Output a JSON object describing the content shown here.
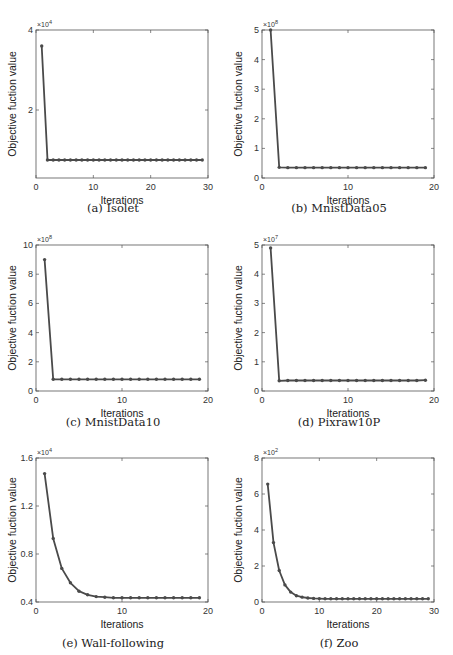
{
  "figure": {
    "panels": [
      {
        "id": "a",
        "caption": "(a) Isolet"
      },
      {
        "id": "b",
        "caption": "(b) MnistData05"
      },
      {
        "id": "c",
        "caption": "(c) MnistData10"
      },
      {
        "id": "d",
        "caption": "(d) Pixraw10P"
      },
      {
        "id": "e",
        "caption": "(e) Wall-following"
      },
      {
        "id": "f",
        "caption": "(f) Zoo"
      }
    ],
    "line_color": "#4a4a4a"
  },
  "chart_data": [
    {
      "type": "line",
      "title": "(a) Isolet",
      "xlabel": "Iterations",
      "ylabel": "Objective fuction value",
      "y_multiplier": "×10^4",
      "y_exponent": "4",
      "xlim": [
        0,
        30
      ],
      "ylim": [
        0.3,
        4
      ],
      "xticks": [
        0,
        10,
        20,
        30
      ],
      "yticks": [
        2,
        4
      ],
      "grid": false,
      "x": [
        1,
        2,
        3,
        4,
        5,
        6,
        7,
        8,
        9,
        10,
        11,
        12,
        13,
        14,
        15,
        16,
        17,
        18,
        19,
        20,
        21,
        22,
        23,
        24,
        25,
        26,
        27,
        28,
        29
      ],
      "y": [
        3.6,
        0.75,
        0.75,
        0.75,
        0.75,
        0.75,
        0.75,
        0.75,
        0.75,
        0.75,
        0.75,
        0.75,
        0.75,
        0.75,
        0.75,
        0.75,
        0.75,
        0.75,
        0.75,
        0.75,
        0.75,
        0.75,
        0.75,
        0.75,
        0.75,
        0.75,
        0.75,
        0.75,
        0.75
      ]
    },
    {
      "type": "line",
      "title": "(b) MnistData05",
      "xlabel": "Iterations",
      "ylabel": "Objective fuction value",
      "y_multiplier": "×10^8",
      "y_exponent": "8",
      "xlim": [
        0,
        20
      ],
      "ylim": [
        0,
        5
      ],
      "xticks": [
        0,
        10,
        20
      ],
      "yticks": [
        0,
        1,
        2,
        3,
        4,
        5
      ],
      "grid": false,
      "x": [
        1,
        2,
        3,
        4,
        5,
        6,
        7,
        8,
        9,
        10,
        11,
        12,
        13,
        14,
        15,
        16,
        17,
        18,
        19
      ],
      "y": [
        5.0,
        0.36,
        0.35,
        0.35,
        0.35,
        0.35,
        0.35,
        0.35,
        0.35,
        0.35,
        0.35,
        0.35,
        0.35,
        0.35,
        0.35,
        0.35,
        0.35,
        0.35,
        0.35
      ]
    },
    {
      "type": "line",
      "title": "(c) MnistData10",
      "xlabel": "Iterations",
      "ylabel": "Objective fuction value",
      "y_multiplier": "×10^8",
      "y_exponent": "8",
      "xlim": [
        0,
        20
      ],
      "ylim": [
        0,
        10
      ],
      "xticks": [
        0,
        10,
        20
      ],
      "yticks": [
        0,
        2,
        4,
        6,
        8,
        10
      ],
      "grid": false,
      "x": [
        1,
        2,
        3,
        4,
        5,
        6,
        7,
        8,
        9,
        10,
        11,
        12,
        13,
        14,
        15,
        16,
        17,
        18,
        19
      ],
      "y": [
        9.0,
        0.8,
        0.8,
        0.8,
        0.8,
        0.8,
        0.8,
        0.8,
        0.8,
        0.8,
        0.8,
        0.8,
        0.8,
        0.8,
        0.8,
        0.8,
        0.8,
        0.8,
        0.8
      ]
    },
    {
      "type": "line",
      "title": "(d) Pixraw10P",
      "xlabel": "Iterations",
      "ylabel": "Objective fuction value",
      "y_multiplier": "×10^7",
      "y_exponent": "7",
      "xlim": [
        0,
        20
      ],
      "ylim": [
        0,
        5
      ],
      "xticks": [
        0,
        10,
        20
      ],
      "yticks": [
        0,
        1,
        2,
        3,
        4,
        5
      ],
      "grid": false,
      "x": [
        1,
        2,
        3,
        4,
        5,
        6,
        7,
        8,
        9,
        10,
        11,
        12,
        13,
        14,
        15,
        16,
        17,
        18,
        19
      ],
      "y": [
        4.9,
        0.35,
        0.36,
        0.36,
        0.36,
        0.36,
        0.36,
        0.36,
        0.36,
        0.36,
        0.36,
        0.36,
        0.36,
        0.36,
        0.36,
        0.36,
        0.36,
        0.36,
        0.37
      ]
    },
    {
      "type": "line",
      "title": "(e) Wall-following",
      "xlabel": "Iterations",
      "ylabel": "Objective fuction value",
      "y_multiplier": "×10^4",
      "y_exponent": "4",
      "xlim": [
        0,
        20
      ],
      "ylim": [
        0.4,
        1.6
      ],
      "xticks": [
        0,
        10,
        20
      ],
      "yticks": [
        0.4,
        0.8,
        1.2,
        1.6
      ],
      "grid": false,
      "x": [
        1,
        2,
        3,
        4,
        5,
        6,
        7,
        8,
        9,
        10,
        11,
        12,
        13,
        14,
        15,
        16,
        17,
        18,
        19
      ],
      "y": [
        1.47,
        0.93,
        0.68,
        0.56,
        0.49,
        0.46,
        0.445,
        0.44,
        0.435,
        0.435,
        0.435,
        0.435,
        0.435,
        0.435,
        0.435,
        0.435,
        0.435,
        0.435,
        0.435
      ]
    },
    {
      "type": "line",
      "title": "(f) Zoo",
      "xlabel": "Iterations",
      "ylabel": "Objective fuction value",
      "y_multiplier": "×10^2",
      "y_exponent": "2",
      "xlim": [
        0,
        30
      ],
      "ylim": [
        0,
        8
      ],
      "xticks": [
        0,
        10,
        20,
        30
      ],
      "yticks": [
        0,
        2,
        4,
        6,
        8
      ],
      "grid": false,
      "x": [
        1,
        2,
        3,
        4,
        5,
        6,
        7,
        8,
        9,
        10,
        11,
        12,
        13,
        14,
        15,
        16,
        17,
        18,
        19,
        20,
        21,
        22,
        23,
        24,
        25,
        26,
        27,
        28,
        29
      ],
      "y": [
        6.55,
        3.3,
        1.75,
        0.95,
        0.55,
        0.35,
        0.27,
        0.22,
        0.2,
        0.19,
        0.18,
        0.18,
        0.18,
        0.18,
        0.18,
        0.18,
        0.18,
        0.18,
        0.18,
        0.18,
        0.18,
        0.18,
        0.18,
        0.18,
        0.18,
        0.18,
        0.18,
        0.18,
        0.18
      ]
    }
  ]
}
